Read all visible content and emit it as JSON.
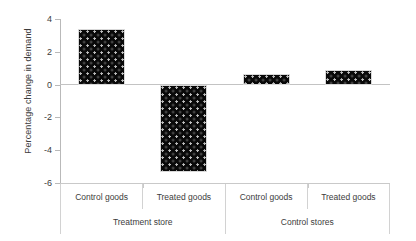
{
  "chart_data": {
    "type": "bar",
    "title": "",
    "xlabel": "",
    "ylabel": "Percentage change in demand",
    "ylim": [
      -6,
      4
    ],
    "yticks": [
      4,
      2,
      0,
      -2,
      -4,
      -6
    ],
    "ytick_labels": [
      "4",
      "2",
      "0",
      "-2",
      "-4",
      "-6"
    ],
    "grid": false,
    "legend": null,
    "categories": [
      "Control goods",
      "Treated goods",
      "Control goods",
      "Treated goods"
    ],
    "groups": [
      {
        "label": "Treatment store",
        "span": 2
      },
      {
        "label": "Control stores",
        "span": 2
      }
    ],
    "values": [
      3.4,
      -5.3,
      0.65,
      0.9
    ],
    "bar_color": "#0a0a0a",
    "bar_pattern": "dotted-texture"
  },
  "axis": {
    "y_title": "Percentage change in demand"
  }
}
